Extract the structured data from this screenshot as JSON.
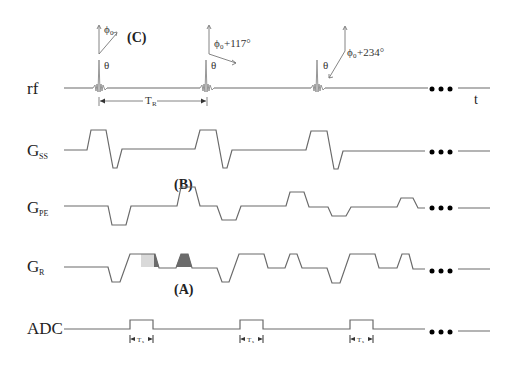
{
  "diagram": {
    "type": "MRI pulse sequence timing diagram",
    "rows": [
      {
        "id": "rf",
        "label": "rf",
        "subscript": ""
      },
      {
        "id": "gss",
        "label": "G",
        "subscript": "SS"
      },
      {
        "id": "gpe",
        "label": "G",
        "subscript": "PE"
      },
      {
        "id": "gr",
        "label": "G",
        "subscript": "R"
      },
      {
        "id": "adc",
        "label": "ADC",
        "subscript": ""
      }
    ],
    "time_axis_label": "t",
    "flip_angle_label": "θ",
    "phase_labels": {
      "first": "ϕ",
      "first_sub": "0",
      "second_prefix": "ϕ",
      "second_sub": "0",
      "second_suffix": "+117°",
      "third_prefix": "ϕ",
      "third_sub": "0",
      "third_suffix": "+234°"
    },
    "tr_label": "T",
    "tr_sub": "R",
    "ts_label": "T",
    "ts_sub": "s",
    "annotations": {
      "a": "(A)",
      "b": "(B)",
      "c": "(C)"
    },
    "continuation": "•••",
    "colors": {
      "line": "#6a6a6a",
      "shade_light": "#d9d9d9",
      "shade_dark": "#6b6b6b"
    }
  }
}
